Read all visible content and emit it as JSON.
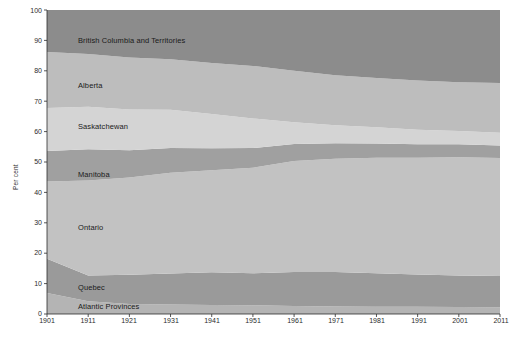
{
  "chart_data": {
    "type": "area",
    "stacked": true,
    "title": "",
    "subtitle": "",
    "xlabel": "",
    "ylabel": "Per cent",
    "xlim": [
      1901,
      2011
    ],
    "ylim": [
      0,
      100
    ],
    "grid": false,
    "legend_position": "inline-band-labels",
    "x": [
      1901,
      1911,
      1921,
      1931,
      1941,
      1951,
      1961,
      1971,
      1981,
      1991,
      2001,
      2011
    ],
    "x_tick_labels": [
      "1901",
      "1911",
      "1921",
      "1931",
      "1941",
      "1951",
      "1961",
      "1971",
      "1981",
      "1991",
      "2001",
      "2011"
    ],
    "y_tick_labels": [
      "0",
      "10",
      "20",
      "30",
      "40",
      "50",
      "60",
      "70",
      "80",
      "90",
      "100"
    ],
    "y_ticks": [
      0,
      10,
      20,
      30,
      40,
      50,
      60,
      70,
      80,
      90,
      100
    ],
    "series": [
      {
        "name": "Atlantic Provinces",
        "color": "#b4b4b4",
        "values": [
          6.9,
          4.2,
          3.3,
          3.1,
          3.0,
          2.9,
          2.6,
          2.5,
          2.4,
          2.4,
          2.3,
          2.2
        ]
      },
      {
        "name": "Quebec",
        "color": "#9a9a9a",
        "values": [
          11.3,
          8.5,
          9.6,
          10.2,
          10.7,
          10.5,
          11.2,
          11.3,
          11.0,
          10.6,
          10.4,
          10.3
        ]
      },
      {
        "name": "Ontario",
        "color": "#c2c2c2",
        "values": [
          25.4,
          31.2,
          32.0,
          33.2,
          33.6,
          34.7,
          36.5,
          37.3,
          38.0,
          38.4,
          38.9,
          38.8
        ]
      },
      {
        "name": "Manitoba",
        "color": "#a0a0a0",
        "values": [
          10.0,
          10.3,
          9.0,
          8.1,
          7.2,
          6.5,
          5.6,
          5.1,
          4.7,
          4.4,
          4.2,
          4.1
        ]
      },
      {
        "name": "Saskatchewan",
        "color": "#d4d4d4",
        "values": [
          14.2,
          14.0,
          13.4,
          12.6,
          11.3,
          9.7,
          7.2,
          5.9,
          5.3,
          4.8,
          4.4,
          4.2
        ]
      },
      {
        "name": "Alberta",
        "color": "#bdbdbd",
        "values": [
          18.4,
          17.3,
          17.1,
          16.6,
          16.8,
          17.3,
          16.9,
          16.4,
          16.2,
          16.2,
          16.0,
          16.4
        ]
      },
      {
        "name": "British Columbia and Territories",
        "color": "#8c8c8c",
        "values": [
          13.8,
          14.5,
          15.6,
          16.2,
          17.4,
          18.4,
          20.0,
          21.5,
          22.4,
          23.2,
          23.8,
          24.0
        ]
      }
    ],
    "cumulative_tops": {
      "note": "stacked upper boundary of each band, per cent, bottom to top",
      "Atlantic Provinces": [
        6.9,
        4.2,
        3.3,
        3.1,
        3.0,
        2.9,
        2.6,
        2.5,
        2.4,
        2.4,
        2.3,
        2.2
      ],
      "Quebec": [
        18.2,
        12.7,
        12.9,
        13.3,
        13.7,
        13.4,
        13.8,
        13.8,
        13.4,
        13.0,
        12.7,
        12.5
      ],
      "Ontario": [
        43.6,
        43.9,
        44.9,
        46.5,
        47.3,
        48.1,
        50.3,
        51.1,
        51.4,
        51.4,
        51.6,
        51.3
      ],
      "Manitoba": [
        53.6,
        54.2,
        53.9,
        54.6,
        54.5,
        54.6,
        55.9,
        56.2,
        56.1,
        55.8,
        55.8,
        55.4
      ],
      "Saskatchewan": [
        67.8,
        68.2,
        67.3,
        67.2,
        65.8,
        64.3,
        63.1,
        62.1,
        61.4,
        60.6,
        60.2,
        59.6
      ],
      "Alberta": [
        86.2,
        85.5,
        84.4,
        83.8,
        82.6,
        81.6,
        80.0,
        78.5,
        77.6,
        76.8,
        76.2,
        76.0
      ],
      "British Columbia and Territories": [
        100,
        100,
        100,
        100,
        100,
        100,
        100,
        100,
        100,
        100,
        100,
        100
      ]
    },
    "band_labels": [
      {
        "text": "British Columbia and Territories",
        "x_px": 78,
        "y_px": 41
      },
      {
        "text": "Alberta",
        "x_px": 78,
        "y_px": 86
      },
      {
        "text": "Saskatchewan",
        "x_px": 78,
        "y_px": 127
      },
      {
        "text": "Manitoba",
        "x_px": 78,
        "y_px": 175
      },
      {
        "text": "Ontario",
        "x_px": 78,
        "y_px": 228
      },
      {
        "text": "Quebec",
        "x_px": 78,
        "y_px": 288
      },
      {
        "text": "Atlantic Provinces",
        "x_px": 78,
        "y_px": 307
      }
    ],
    "colors": {
      "axis": "#2b2b2b",
      "text": "#1a1a1a",
      "background": "#ffffff"
    }
  }
}
